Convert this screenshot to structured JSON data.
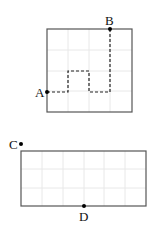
{
  "figure_top": {
    "shape": "square",
    "grid": {
      "cols": 4,
      "rows": 4
    },
    "points": [
      {
        "label": "A",
        "position": "left edge, one cell above bottom"
      },
      {
        "label": "B",
        "position": "top edge, one cell left of right"
      }
    ],
    "path_style": "dashed"
  },
  "figure_bottom": {
    "shape": "rectangle",
    "grid": {
      "cols": 6,
      "rows": 3
    },
    "points": [
      {
        "label": "C",
        "position": "top-left corner area of left edge"
      },
      {
        "label": "D",
        "position": "bottom edge, middle"
      }
    ]
  },
  "labels": {
    "a": "A",
    "b": "B",
    "c": "C",
    "d": "D"
  },
  "colors": {
    "border": "#555555",
    "grid": "#e6e6e6",
    "path": "#222222",
    "point": "#000000"
  }
}
